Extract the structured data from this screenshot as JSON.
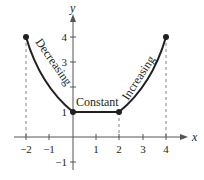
{
  "figure": {
    "x_axis": {
      "label": "x",
      "ticks": [
        {
          "value": -2,
          "label": "−2"
        },
        {
          "value": -1,
          "label": "−1"
        },
        {
          "value": 1,
          "label": "1"
        },
        {
          "value": 2,
          "label": "2"
        },
        {
          "value": 3,
          "label": "3"
        },
        {
          "value": 4,
          "label": "4"
        }
      ]
    },
    "y_axis": {
      "label": "y",
      "ticks": [
        {
          "value": -1,
          "label": "−1"
        },
        {
          "value": 1,
          "label": "1"
        },
        {
          "value": 2,
          "label": ""
        },
        {
          "value": 3,
          "label": "3"
        },
        {
          "value": 4,
          "label": "4"
        }
      ]
    },
    "segments": [
      {
        "label": "Decreasing",
        "from": [
          -2,
          4
        ],
        "to": [
          0,
          1
        ]
      },
      {
        "label": "Constant",
        "from": [
          0,
          1
        ],
        "to": [
          2,
          1
        ]
      },
      {
        "label": "Increasing",
        "from": [
          2,
          1
        ],
        "to": [
          4,
          4
        ]
      }
    ],
    "points": [
      {
        "x": -2,
        "y": 4
      },
      {
        "x": 0,
        "y": 1
      },
      {
        "x": 2,
        "y": 1
      },
      {
        "x": 4,
        "y": 4
      }
    ],
    "colors": {
      "ink": "#231f20",
      "axis": "#555555",
      "dashed": "#666666"
    }
  }
}
